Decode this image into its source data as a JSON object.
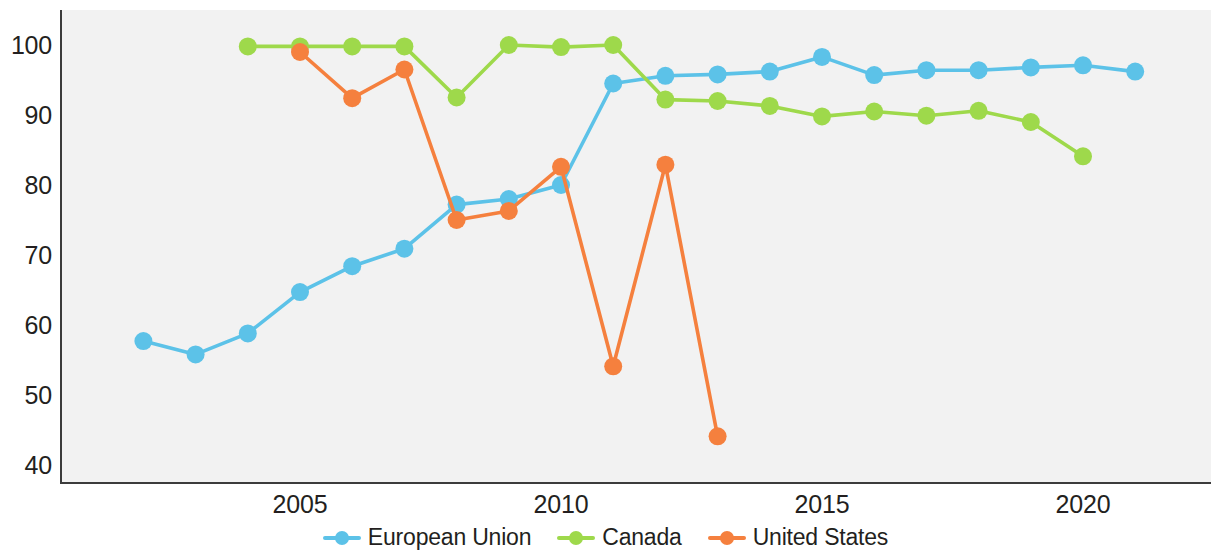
{
  "chart_data": {
    "type": "line",
    "title": "",
    "subtitle": "",
    "xlabel": "",
    "ylabel": "",
    "xlim": [
      2001,
      2021.6
    ],
    "ylim": [
      37,
      103
    ],
    "grid": false,
    "legend_position": "bottom-center",
    "x_tick_labels": [
      "2005",
      "2010",
      "2015",
      "2020"
    ],
    "x_tick_values": [
      2005,
      2010,
      2015,
      2020
    ],
    "y_tick_labels": [
      "100",
      "90",
      "80",
      "70",
      "60",
      "50",
      "40"
    ],
    "y_tick_values": [
      100,
      90,
      80,
      70,
      60,
      50,
      40
    ],
    "series": [
      {
        "name": "European Union",
        "color": "#5cc2e8",
        "x": [
          2002,
          2003,
          2004,
          2005,
          2006,
          2007,
          2008,
          2009,
          2010,
          2011,
          2012,
          2013,
          2014,
          2015,
          2016,
          2017,
          2018,
          2019,
          2020,
          2021
        ],
        "values": [
          57.7,
          55.8,
          58.8,
          64.7,
          68.4,
          70.9,
          77.2,
          78.0,
          80.0,
          94.5,
          95.6,
          95.8,
          96.2,
          98.3,
          95.7,
          96.4,
          96.4,
          96.8,
          97.1,
          96.2
        ]
      },
      {
        "name": "Canada",
        "color": "#9ed94b",
        "x": [
          2004,
          2005,
          2006,
          2007,
          2008,
          2009,
          2010,
          2011,
          2012,
          2013,
          2014,
          2015,
          2016,
          2017,
          2018,
          2019,
          2020
        ],
        "values": [
          99.8,
          99.8,
          99.8,
          99.8,
          92.5,
          100.0,
          99.7,
          100.0,
          92.2,
          92.0,
          91.3,
          89.8,
          90.5,
          89.9,
          90.6,
          89.0,
          84.1
        ]
      },
      {
        "name": "United States",
        "color": "#f5803e",
        "x": [
          2005,
          2006,
          2007,
          2008,
          2009,
          2010,
          2011,
          2012,
          2013
        ],
        "values": [
          99.0,
          92.4,
          96.5,
          75.0,
          76.3,
          82.6,
          54.1,
          82.9,
          44.1
        ]
      }
    ]
  },
  "legend": {
    "items": [
      {
        "label": "European Union",
        "color": "#5cc2e8"
      },
      {
        "label": "Canada",
        "color": "#9ed94b"
      },
      {
        "label": "United States",
        "color": "#f5803e"
      }
    ]
  },
  "colors": {
    "european_union": "#5cc2e8",
    "canada": "#9ed94b",
    "united_states": "#f5803e",
    "plot_background": "#f2f2f2",
    "axis": "#3c3c3c",
    "text": "#231f20"
  }
}
